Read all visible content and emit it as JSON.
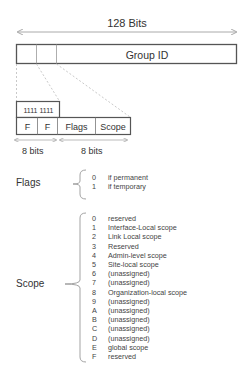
{
  "diagram": {
    "title": "128 Bits",
    "group_box": {
      "label": "Group ID"
    },
    "prefix_box": {
      "label": "1111 1111"
    },
    "fields": [
      {
        "label": "F"
      },
      {
        "label": "F"
      },
      {
        "label": "Flags"
      },
      {
        "label": "Scope"
      }
    ],
    "bit_labels": [
      "8 bits",
      "8 bits"
    ],
    "flags": {
      "label": "Flags",
      "items": [
        {
          "key": "0",
          "value": "if permanent"
        },
        {
          "key": "1",
          "value": "if temporary"
        }
      ]
    },
    "scope": {
      "label": "Scope",
      "items": [
        {
          "key": "0",
          "value": "reserved"
        },
        {
          "key": "1",
          "value": "Interface-Local scope"
        },
        {
          "key": "2",
          "value": "Link Local scope"
        },
        {
          "key": "3",
          "value": "Reserved"
        },
        {
          "key": "4",
          "value": "Admin-level scope"
        },
        {
          "key": "5",
          "value": "Site-local scope"
        },
        {
          "key": "6",
          "value": "(unassigned)"
        },
        {
          "key": "7",
          "value": "(unassigned)"
        },
        {
          "key": "8",
          "value": "Organization-local scope"
        },
        {
          "key": "9",
          "value": "(unassigned)"
        },
        {
          "key": "A",
          "value": "(unassigned)"
        },
        {
          "key": "B",
          "value": "(unassigned)"
        },
        {
          "key": "C",
          "value": "(unassigned)"
        },
        {
          "key": "D",
          "value": "(unassigned)"
        },
        {
          "key": "E",
          "value": "global scope"
        },
        {
          "key": "F",
          "value": "reserved"
        }
      ]
    },
    "colors": {
      "line": "#555555",
      "light_line": "#aaaaaa",
      "text": "#333333"
    }
  }
}
